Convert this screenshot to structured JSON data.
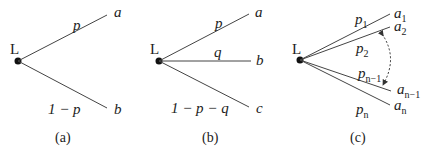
{
  "diagrams": [
    {
      "id": "a",
      "root_label": "L",
      "caption": "(a)",
      "branches": [
        {
          "prob": "p",
          "outcome": "a"
        },
        {
          "prob": "1 − p",
          "outcome": "b"
        }
      ]
    },
    {
      "id": "b",
      "root_label": "L",
      "caption": "(b)",
      "branches": [
        {
          "prob": "p",
          "outcome": "a"
        },
        {
          "prob": "q",
          "outcome": "b"
        },
        {
          "prob": "1 − p − q",
          "outcome": "c"
        }
      ]
    },
    {
      "id": "c",
      "root_label": "L",
      "caption": "(c)",
      "branches": [
        {
          "prob": "p",
          "prob_sub": "1",
          "outcome": "a",
          "outcome_sub": "1"
        },
        {
          "prob": "p",
          "prob_sub": "2",
          "outcome": "a",
          "outcome_sub": "2"
        },
        {
          "prob": "p",
          "prob_sub": "n−1",
          "outcome": "a",
          "outcome_sub": "n−1"
        },
        {
          "prob": "p",
          "prob_sub": "n",
          "outcome": "a",
          "outcome_sub": "n"
        }
      ],
      "ellipsis_arrow": "dashed-double-arrow"
    }
  ]
}
